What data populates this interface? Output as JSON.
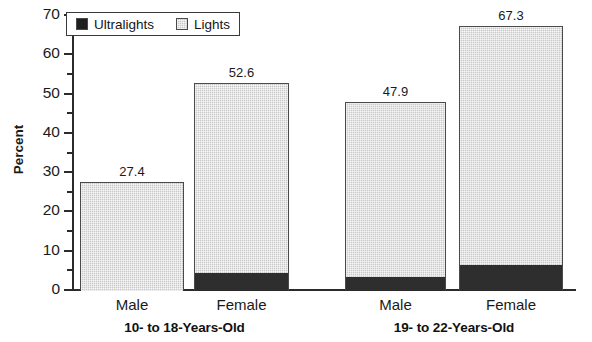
{
  "chart_data": {
    "type": "bar",
    "subtype": "stacked-bar",
    "title": "",
    "xlabel": "",
    "ylabel": "Percent",
    "ylim": [
      0,
      70
    ],
    "ytick_step": 10,
    "yminor_step": 5,
    "grid": false,
    "legend_position": "top-left",
    "ytick_labels": [
      "70",
      "60",
      "50",
      "40",
      "30",
      "20",
      "10",
      "0"
    ],
    "ytick_values": [
      70,
      60,
      50,
      40,
      30,
      20,
      10,
      0
    ],
    "yminor_values": [
      65,
      55,
      45,
      35,
      25,
      15,
      5
    ],
    "categories": [
      "Male",
      "Female",
      "Male",
      "Female"
    ],
    "groups": [
      {
        "label": "10- to 18-Years-Old",
        "categories": [
          "Male",
          "Female"
        ]
      },
      {
        "label": "19- to 22-Years-Old",
        "categories": [
          "Male",
          "Female"
        ]
      }
    ],
    "series": [
      {
        "name": "Ultralights",
        "color": "#2e2e2e",
        "values": [
          0.0,
          4.3,
          3.2,
          6.4
        ]
      },
      {
        "name": "Lights",
        "color": "#c9c9c9",
        "values": [
          27.4,
          48.3,
          44.7,
          60.9
        ]
      }
    ],
    "bars": [
      {
        "group": "10- to 18-Years-Old",
        "category": "Male",
        "total": 27.4,
        "total_label": "27.4",
        "ultralights": 0.0,
        "lights": 27.4
      },
      {
        "group": "10- to 18-Years-Old",
        "category": "Female",
        "total": 52.6,
        "total_label": "52.6",
        "ultralights": 4.3,
        "lights": 48.3
      },
      {
        "group": "19- to 22-Years-Old",
        "category": "Male",
        "total": 47.9,
        "total_label": "47.9",
        "ultralights": 3.2,
        "lights": 44.7
      },
      {
        "group": "19- to 22-Years-Old",
        "category": "Female",
        "total": 67.3,
        "total_label": "67.3",
        "ultralights": 6.4,
        "lights": 60.9
      }
    ],
    "data_labels": [
      "27.4",
      "52.6",
      "47.9",
      "67.3"
    ]
  },
  "legend": {
    "entries": [
      {
        "label": "Ultralights",
        "swatch": "ultralights-swatch",
        "color": "#1f1f1f"
      },
      {
        "label": "Lights",
        "swatch": "lights-swatch",
        "color": "#c9c9c9"
      }
    ]
  },
  "axis": {
    "y_title": "Percent",
    "y_labels": [
      "70",
      "60",
      "50",
      "40",
      "30",
      "20",
      "10",
      "0"
    ]
  },
  "x_labels": [
    "Male",
    "Female",
    "Male",
    "Female"
  ],
  "group_labels": [
    "10- to 18-Years-Old",
    "19- to 22-Years-Old"
  ],
  "colors": {
    "ultralights": "#2e2e2e",
    "lights": "#c9c9c9",
    "axis": "#2b2b2b",
    "text": "#1a1a1a",
    "background": "#ffffff"
  }
}
